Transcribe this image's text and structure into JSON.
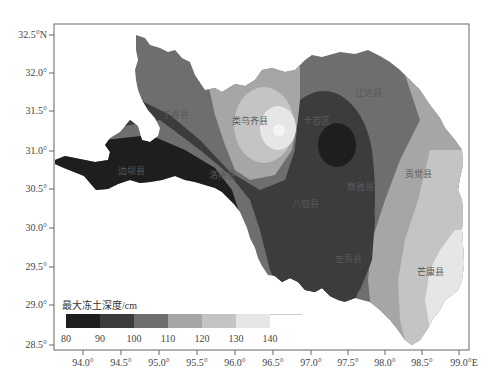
{
  "map": {
    "frame": {
      "left": 54,
      "top": 24,
      "right": 469,
      "bottom": 350
    },
    "y_axis": {
      "ticks": [
        {
          "label": "32.5°N",
          "y": 35
        },
        {
          "label": "32.0°",
          "y": 73
        },
        {
          "label": "31.5°",
          "y": 111
        },
        {
          "label": "31.0°",
          "y": 151
        },
        {
          "label": "30.5°",
          "y": 189
        },
        {
          "label": "30.0°",
          "y": 228
        },
        {
          "label": "29.5°",
          "y": 267
        },
        {
          "label": "29.0°",
          "y": 305
        },
        {
          "label": "28.5°",
          "y": 345
        }
      ]
    },
    "x_axis": {
      "ticks": [
        {
          "label": "94.0°",
          "x": 83
        },
        {
          "label": "94.5°",
          "x": 121
        },
        {
          "label": "95.0°",
          "x": 159
        },
        {
          "label": "95.5°",
          "x": 197
        },
        {
          "label": "96.0°",
          "x": 235
        },
        {
          "label": "96.5°",
          "x": 273
        },
        {
          "label": "97.0°",
          "x": 311
        },
        {
          "label": "97.5°",
          "x": 348
        },
        {
          "label": "98.0°",
          "x": 385
        },
        {
          "label": "98.5°",
          "x": 422
        },
        {
          "label": "99.0°E",
          "x": 459
        }
      ]
    },
    "counties": [
      {
        "name": "丁青县",
        "x": 175,
        "y": 118
      },
      {
        "name": "类乌齐县",
        "x": 250,
        "y": 124
      },
      {
        "name": "卡若区",
        "x": 315,
        "y": 124
      },
      {
        "name": "江达县",
        "x": 368,
        "y": 96
      },
      {
        "name": "边坝县",
        "x": 119,
        "y": 172
      },
      {
        "name": "洛隆县",
        "x": 213,
        "y": 178
      },
      {
        "name": "察雅县",
        "x": 353,
        "y": 187
      },
      {
        "name": "贡觉县",
        "x": 412,
        "y": 175
      },
      {
        "name": "八宿县",
        "x": 295,
        "y": 208
      },
      {
        "name": "左贡县",
        "x": 343,
        "y": 262
      },
      {
        "name": "芒康县",
        "x": 420,
        "y": 273
      }
    ]
  },
  "legend": {
    "title": "最大冻土深度/cm",
    "classes": [
      {
        "range": "80-90",
        "color": "#1e1e1e"
      },
      {
        "range": "90-100",
        "color": "#3c3c3c"
      },
      {
        "range": "100-110",
        "color": "#6e6e6e"
      },
      {
        "range": "110-120",
        "color": "#a6a6a6"
      },
      {
        "range": "120-130",
        "color": "#c4c4c4"
      },
      {
        "range": "130-140",
        "color": "#e6e6e6"
      }
    ],
    "tick_labels": [
      "80",
      "90",
      "100",
      "110",
      "120",
      "130",
      "140"
    ]
  },
  "colors": {
    "c80": "#1e1e1e",
    "c90": "#3c3c3c",
    "c100": "#6e6e6e",
    "c110": "#a6a6a6",
    "c120": "#c4c4c4",
    "c130": "#e6e6e6",
    "c140": "#f5f5f5",
    "frame": "#666666"
  }
}
